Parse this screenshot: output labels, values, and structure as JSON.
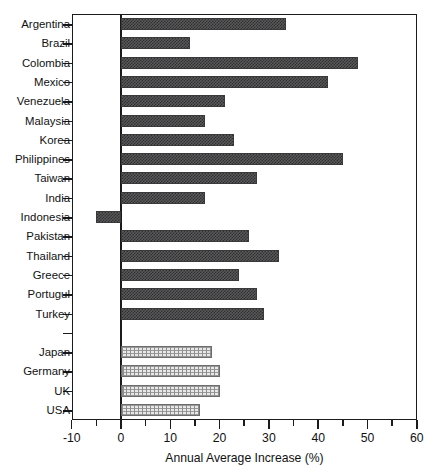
{
  "chart_data": {
    "type": "bar",
    "orientation": "horizontal",
    "title": "",
    "xlabel": "Annual Average Increase (%)",
    "ylabel": "",
    "xlim": [
      -10,
      60
    ],
    "xticks": [
      -10,
      0,
      10,
      20,
      30,
      40,
      50,
      60
    ],
    "xtick_labels": [
      "-10",
      "0",
      "10",
      "20",
      "30",
      "40",
      "50",
      "60"
    ],
    "minor_tick_step": 5,
    "grid": false,
    "legend": null,
    "zero_line": true,
    "categories": [
      "Argentina",
      "Brazil",
      "Colombia",
      "Mexico",
      "Venezuela",
      "Malaysia",
      "Korea",
      "Philippines",
      "Taiwan",
      "India",
      "Indonesia",
      "Pakistan",
      "Thailand",
      "Greece",
      "Portugul",
      "Turkey",
      "",
      "Japan",
      "Germany",
      "UK",
      "USA"
    ],
    "values": [
      33.5,
      14.0,
      48.0,
      42.0,
      21.0,
      17.0,
      23.0,
      45.0,
      27.5,
      17.0,
      -5.0,
      26.0,
      32.0,
      24.0,
      27.5,
      29.0,
      null,
      18.5,
      20.0,
      20.0,
      16.0
    ],
    "series_groups": [
      {
        "name": "developing-economies",
        "style": "dark",
        "members": [
          "Argentina",
          "Brazil",
          "Colombia",
          "Mexico",
          "Venezuela",
          "Malaysia",
          "Korea",
          "Philippines",
          "Taiwan",
          "India",
          "Indonesia",
          "Pakistan",
          "Thailand",
          "Greece",
          "Portugul",
          "Turkey"
        ]
      },
      {
        "name": "developed-economies",
        "style": "light",
        "members": [
          "Japan",
          "Germany",
          "UK",
          "USA"
        ]
      }
    ],
    "bars": [
      {
        "label": "Argentina",
        "value": 33.5,
        "style": "dark",
        "gap": false
      },
      {
        "label": "Brazil",
        "value": 14.0,
        "style": "dark",
        "gap": false
      },
      {
        "label": "Colombia",
        "value": 48.0,
        "style": "dark",
        "gap": false
      },
      {
        "label": "Mexico",
        "value": 42.0,
        "style": "dark",
        "gap": false
      },
      {
        "label": "Venezuela",
        "value": 21.0,
        "style": "dark",
        "gap": false
      },
      {
        "label": "Malaysia",
        "value": 17.0,
        "style": "dark",
        "gap": false
      },
      {
        "label": "Korea",
        "value": 23.0,
        "style": "dark",
        "gap": false
      },
      {
        "label": "Philippines",
        "value": 45.0,
        "style": "dark",
        "gap": false
      },
      {
        "label": "Taiwan",
        "value": 27.5,
        "style": "dark",
        "gap": false
      },
      {
        "label": "India",
        "value": 17.0,
        "style": "dark",
        "gap": false
      },
      {
        "label": "Indonesia",
        "value": -5.0,
        "style": "dark",
        "gap": false
      },
      {
        "label": "Pakistan",
        "value": 26.0,
        "style": "dark",
        "gap": false
      },
      {
        "label": "Thailand",
        "value": 32.0,
        "style": "dark",
        "gap": false
      },
      {
        "label": "Greece",
        "value": 24.0,
        "style": "dark",
        "gap": false
      },
      {
        "label": "Portugul",
        "value": 27.5,
        "style": "dark",
        "gap": false
      },
      {
        "label": "Turkey",
        "value": 29.0,
        "style": "dark",
        "gap": false
      },
      {
        "label": "",
        "value": null,
        "style": "none",
        "gap": true
      },
      {
        "label": "Japan",
        "value": 18.5,
        "style": "light",
        "gap": false
      },
      {
        "label": "Germany",
        "value": 20.0,
        "style": "light",
        "gap": false
      },
      {
        "label": "UK",
        "value": 20.0,
        "style": "light",
        "gap": false
      },
      {
        "label": "USA",
        "value": 16.0,
        "style": "light",
        "gap": false
      }
    ]
  },
  "colors": {
    "axis": "#1b1b1b",
    "bar_dark": "#4a4a4b",
    "bar_light": "#d8d8d8",
    "background": "#ffffff",
    "text": "#111111"
  },
  "geometry": {
    "plot_left": 72,
    "plot_top": 14,
    "plot_width": 345,
    "plot_height": 406,
    "zero_x": 121,
    "px_per_unit": 4.93,
    "row_height": 19.3,
    "row_start": 24.0,
    "bar_height": 12
  }
}
